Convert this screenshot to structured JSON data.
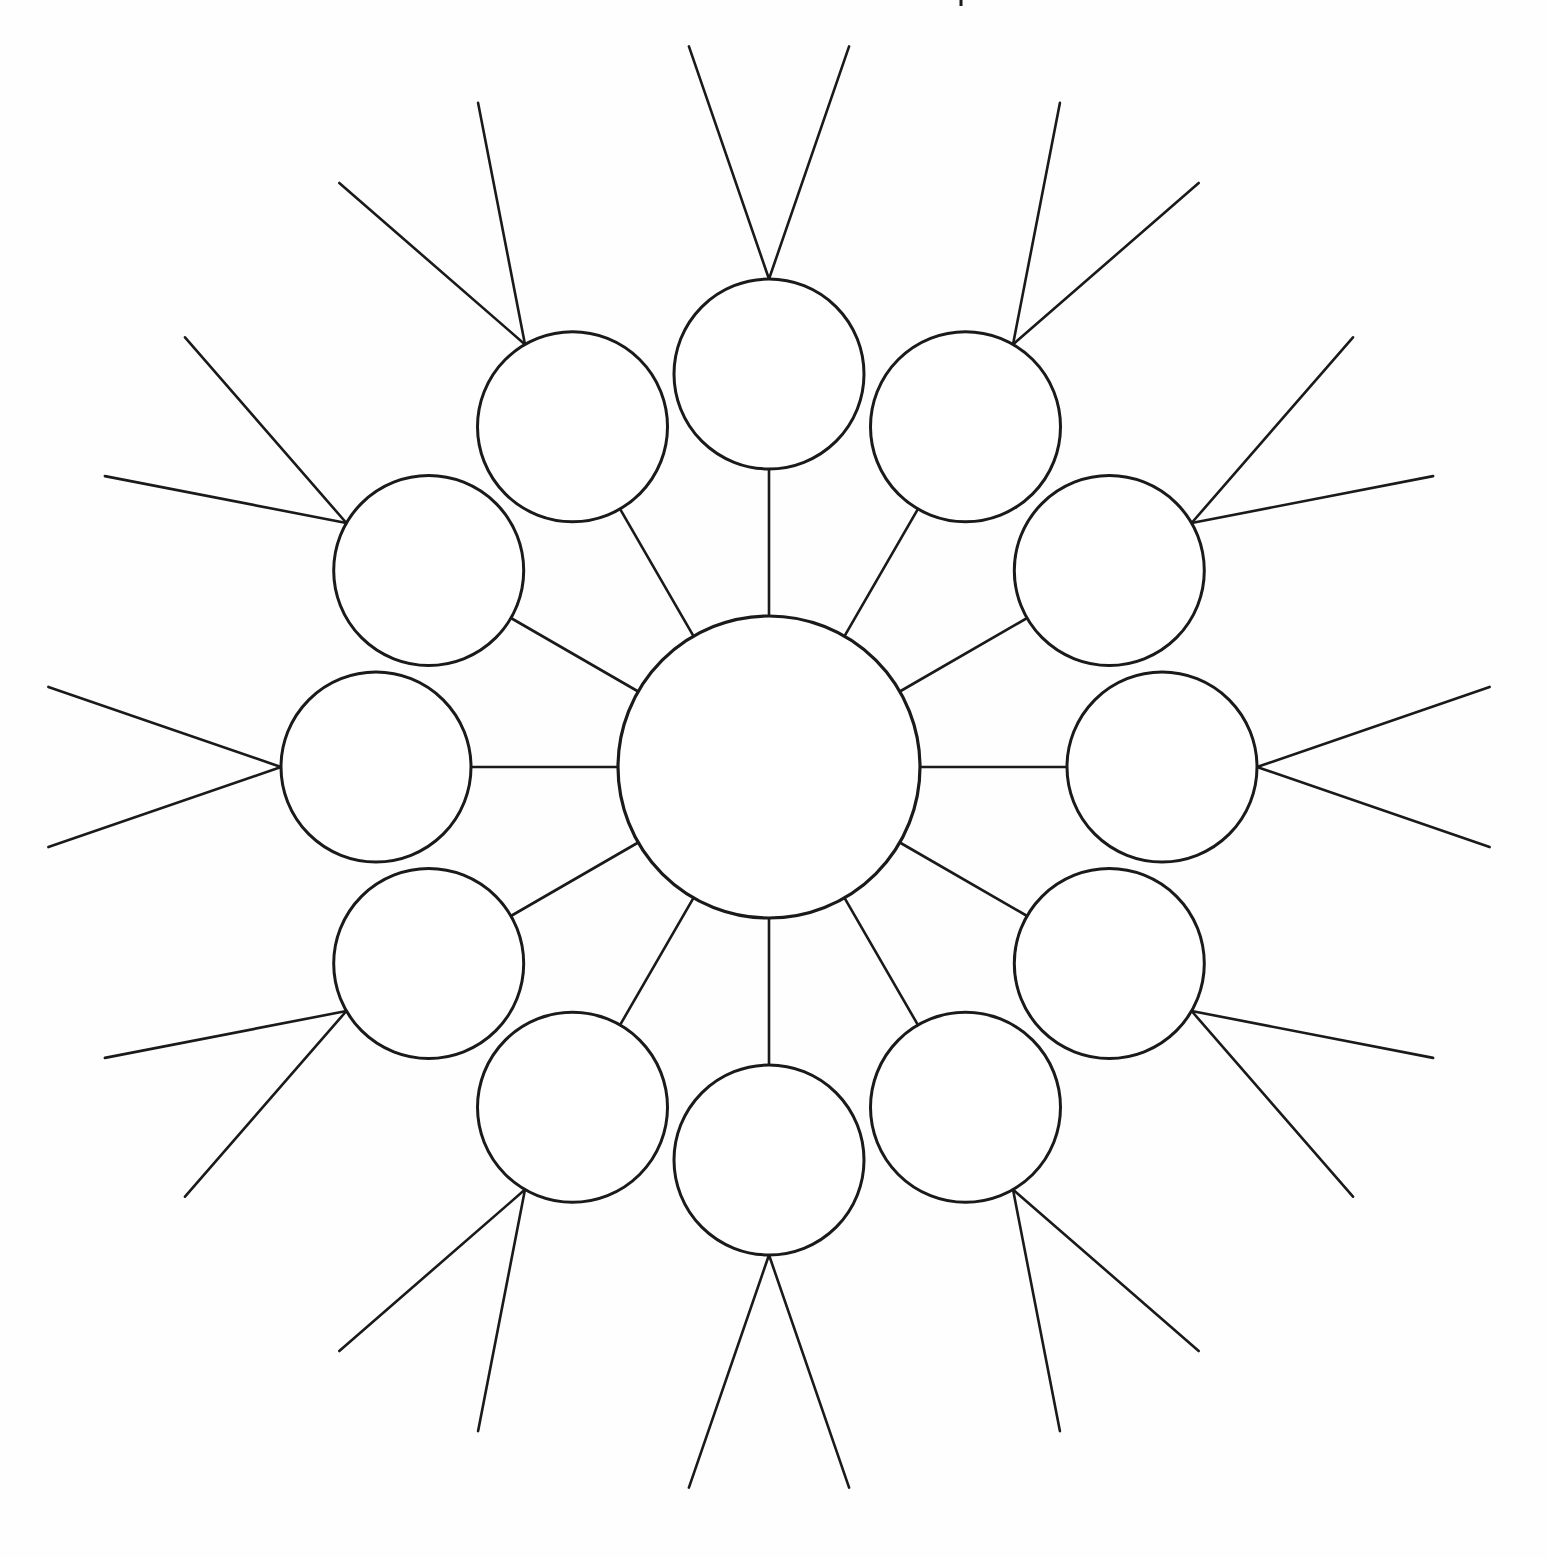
{
  "page": {
    "background_color": "#fefefe",
    "stroke_color": "#1a1a1a",
    "fill_color": "#ffffff",
    "width": 1547,
    "height": 1558
  },
  "diagram": {
    "type": "radial-bubble-map",
    "hub": {
      "name": "central-bubble",
      "cx": 769,
      "cy": 767,
      "r": 151,
      "label": "",
      "stroke_width": 3.2
    },
    "ring": {
      "count": 12,
      "radius": 393,
      "node_radius": 95,
      "start_angle_deg": -90,
      "step_angle_deg": 30,
      "node_stroke_width": 3.0,
      "spoke_stroke_width": 2.6
    },
    "rays": {
      "per_node": 2,
      "length": 246,
      "spread_deg": 19,
      "stroke_width": 2.6
    },
    "nodes": [
      {
        "id": 1,
        "name": "bubble-top",
        "angle_deg": -90,
        "cx": 769,
        "cy": 374,
        "label": ""
      },
      {
        "id": 2,
        "name": "bubble-top-right",
        "angle_deg": -60,
        "cx": 989,
        "cy": 440,
        "label": ""
      },
      {
        "id": 3,
        "name": "bubble-upper-right",
        "angle_deg": -30,
        "cx": 1139,
        "cy": 600,
        "label": ""
      },
      {
        "id": 4,
        "name": "bubble-right",
        "angle_deg": 0,
        "cx": 1162,
        "cy": 767,
        "label": ""
      },
      {
        "id": 5,
        "name": "bubble-lower-right",
        "angle_deg": 30,
        "cx": 1109,
        "cy": 1020,
        "label": ""
      },
      {
        "id": 6,
        "name": "bubble-bottom-right",
        "angle_deg": 60,
        "cx": 885,
        "cy": 1147,
        "label": ""
      },
      {
        "id": 7,
        "name": "bubble-bottom",
        "angle_deg": 90,
        "cx": 656,
        "cy": 1143,
        "label": ""
      },
      {
        "id": 8,
        "name": "bubble-bottom-left",
        "angle_deg": 120,
        "cx": 458,
        "cy": 1017,
        "label": ""
      },
      {
        "id": 9,
        "name": "bubble-lower-left",
        "angle_deg": 150,
        "cx": 366,
        "cy": 816,
        "label": ""
      },
      {
        "id": 10,
        "name": "bubble-left",
        "angle_deg": 180,
        "cx": 403,
        "cy": 598,
        "label": ""
      },
      {
        "id": 11,
        "name": "bubble-upper-left",
        "angle_deg": -150,
        "cx": 554,
        "cy": 439,
        "label": ""
      },
      {
        "id": 12,
        "name": "bubble-top-left",
        "angle_deg": -120,
        "cx": 600,
        "cy": 430,
        "label": ""
      }
    ],
    "stray_mark": {
      "name": "edge-tick-mark",
      "x": 961,
      "y": 0,
      "length": 6
    }
  }
}
